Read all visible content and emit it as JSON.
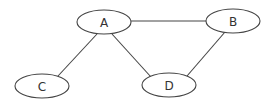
{
  "diagram": {
    "type": "undirected-graph",
    "colors": {
      "stroke": "#444444",
      "node_fill": "#ffffff",
      "label": "#333333",
      "background": "#ffffff"
    },
    "nodes": [
      {
        "id": "A",
        "label": "A",
        "cx": 104,
        "cy": 22,
        "rx": 27,
        "ry": 12
      },
      {
        "id": "B",
        "label": "B",
        "cx": 233,
        "cy": 21,
        "rx": 27,
        "ry": 12
      },
      {
        "id": "C",
        "label": "C",
        "cx": 42,
        "cy": 86,
        "rx": 27,
        "ry": 12
      },
      {
        "id": "D",
        "label": "D",
        "cx": 169,
        "cy": 85,
        "rx": 27,
        "ry": 12
      }
    ],
    "edges": [
      {
        "from": "A",
        "to": "B",
        "x1": 131,
        "y1": 21,
        "x2": 206,
        "y2": 21
      },
      {
        "from": "A",
        "to": "C",
        "x1": 97,
        "y1": 34,
        "x2": 58,
        "y2": 76
      },
      {
        "from": "A",
        "to": "D",
        "x1": 112,
        "y1": 34,
        "x2": 151,
        "y2": 77
      },
      {
        "from": "B",
        "to": "D",
        "x1": 225,
        "y1": 32,
        "x2": 187,
        "y2": 76
      }
    ]
  }
}
